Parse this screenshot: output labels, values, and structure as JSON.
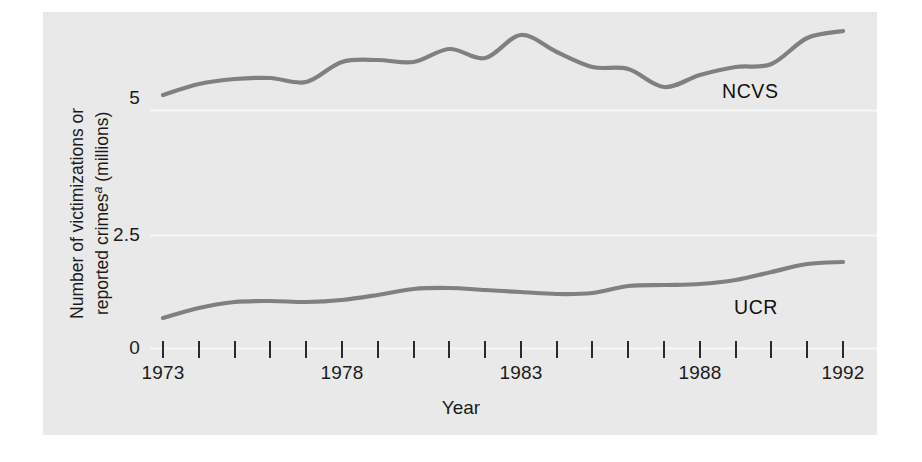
{
  "chart_data": {
    "type": "line",
    "title": "",
    "xlabel": "Year",
    "ylabel": "Number of victimizations or reported crimesᵃ (millions)",
    "ylabel_note": "a",
    "xlim": [
      1973,
      1992
    ],
    "ylim": [
      0,
      6.6
    ],
    "yticks": [
      0,
      2.5,
      5
    ],
    "ytick_labels": [
      "0",
      "2.5",
      "5"
    ],
    "xticks": [
      1973,
      1974,
      1975,
      1976,
      1977,
      1978,
      1979,
      1980,
      1981,
      1982,
      1983,
      1984,
      1985,
      1986,
      1987,
      1988,
      1989,
      1990,
      1991,
      1992
    ],
    "xtick_labels_shown": [
      "1973",
      "1978",
      "1983",
      "1988",
      "1992"
    ],
    "grid": false,
    "legend_position": "inline-annotation",
    "line_color": "#808080",
    "panel_color": "#e9e9e9",
    "x": [
      1973,
      1974,
      1975,
      1976,
      1977,
      1978,
      1979,
      1980,
      1981,
      1982,
      1983,
      1984,
      1985,
      1986,
      1987,
      1988,
      1989,
      1990,
      1991,
      1992
    ],
    "series": [
      {
        "name": "NCVS",
        "label": "NCVS",
        "values": [
          5.06,
          5.28,
          5.38,
          5.4,
          5.32,
          5.72,
          5.76,
          5.72,
          5.98,
          5.8,
          6.26,
          5.92,
          5.62,
          5.58,
          5.22,
          5.46,
          5.62,
          5.68,
          6.2,
          6.34
        ]
      },
      {
        "name": "UCR",
        "label": "UCR",
        "values": [
          0.6,
          0.8,
          0.92,
          0.94,
          0.92,
          0.96,
          1.06,
          1.18,
          1.2,
          1.16,
          1.12,
          1.08,
          1.1,
          1.24,
          1.26,
          1.28,
          1.36,
          1.52,
          1.68,
          1.72
        ]
      }
    ]
  },
  "axes": {
    "ytick_0": "0",
    "ytick_25": "2.5",
    "ytick_5": "5",
    "xtick_1973": "1973",
    "xtick_1978": "1978",
    "xtick_1983": "1983",
    "xtick_1988": "1988",
    "xtick_1992": "1992",
    "x_axis_title": "Year"
  },
  "labels": {
    "ncvs": "NCVS",
    "ucr": "UCR",
    "y_axis_line1": "Number of victimizations or",
    "y_axis_line2": "reported crimes",
    "y_axis_superscript": "a",
    "y_axis_line2_tail": " (millions)"
  }
}
